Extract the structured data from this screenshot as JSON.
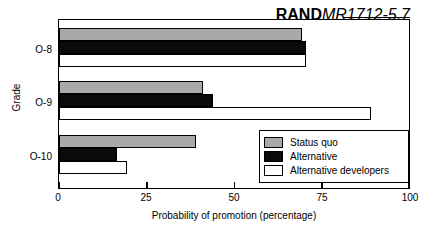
{
  "credit": {
    "brand": "RAND",
    "code": "MR1712-5.7"
  },
  "chart_data": {
    "type": "bar",
    "orientation": "horizontal",
    "title": "",
    "xlabel": "Probability of promotion (percentage)",
    "ylabel": "Grade",
    "categories": [
      "O-8",
      "O-9",
      "O-10"
    ],
    "xlim": [
      0,
      100
    ],
    "xticks": [
      "0",
      "25",
      "50",
      "75",
      "100"
    ],
    "xtick_values": [
      0,
      25,
      50,
      75,
      100
    ],
    "grid": false,
    "legend_position": "lower right",
    "series": [
      {
        "name": "Status quo",
        "color": "#a9a9a9",
        "values": [
          69.5,
          41,
          39
        ]
      },
      {
        "name": "Alternative",
        "color": "#000000",
        "values": [
          70.5,
          44,
          16.5
        ]
      },
      {
        "name": "Alternative developers",
        "color": "#ffffff",
        "values": [
          70.5,
          89,
          19.5
        ]
      }
    ]
  }
}
